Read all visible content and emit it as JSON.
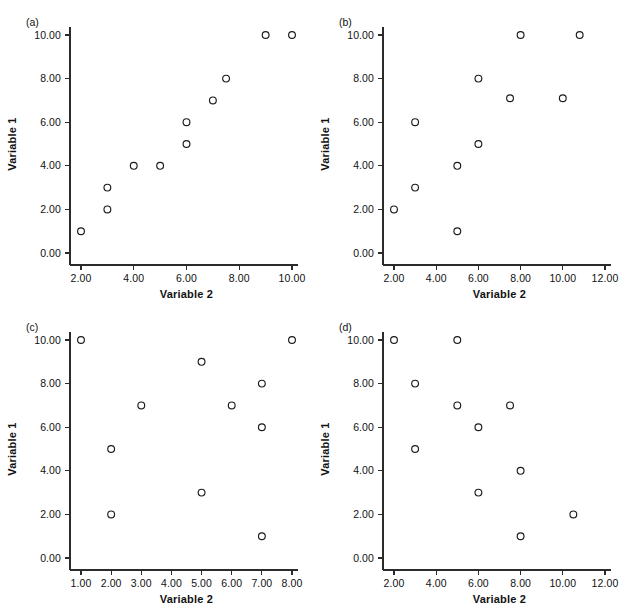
{
  "figure": {
    "panels": [
      {
        "key": "a",
        "label": "(a)",
        "xlabel": "Variable 2",
        "ylabel": "Variable 1",
        "xticks": [
          "2.00",
          "4.00",
          "6.00",
          "8.00",
          "10.00"
        ],
        "yticks": [
          "0.00",
          "2.00",
          "4.00",
          "6.00",
          "8.00",
          "10.00"
        ]
      },
      {
        "key": "b",
        "label": "(b)",
        "xlabel": "Variable 2",
        "ylabel": "Variable 1",
        "xticks": [
          "2.00",
          "4.00",
          "6.00",
          "8.00",
          "10.00",
          "12.00"
        ],
        "yticks": [
          "0.00",
          "2.00",
          "4.00",
          "6.00",
          "8.00",
          "10.00"
        ]
      },
      {
        "key": "c",
        "label": "(c)",
        "xlabel": "Variable 2",
        "ylabel": "Variable 1",
        "xticks": [
          "1.00",
          "2.00",
          "3.00",
          "4.00",
          "5.00",
          "6.00",
          "7.00",
          "8.00"
        ],
        "yticks": [
          "0.00",
          "2.00",
          "4.00",
          "6.00",
          "8.00",
          "10.00"
        ]
      },
      {
        "key": "d",
        "label": "(d)",
        "xlabel": "Variable 2",
        "ylabel": "Variable 1",
        "xticks": [
          "2.00",
          "4.00",
          "6.00",
          "8.00",
          "10.00",
          "12.00"
        ],
        "yticks": [
          "0.00",
          "2.00",
          "4.00",
          "6.00",
          "8.00",
          "10.00"
        ]
      }
    ]
  },
  "style": {
    "marker_color": "#1a1a1a",
    "axis_color": "#2b2b2b",
    "background": "#ffffff",
    "marker_radius": 3.4
  },
  "chart_data": [
    {
      "type": "scatter",
      "title": "(a)",
      "xlabel": "Variable 2",
      "ylabel": "Variable 1",
      "xlim": [
        1.2,
        10.6
      ],
      "ylim": [
        -0.6,
        10.6
      ],
      "xticks": [
        2,
        4,
        6,
        8,
        10
      ],
      "yticks": [
        0,
        2,
        4,
        6,
        8,
        10
      ],
      "grid": false,
      "legend": false,
      "points": [
        {
          "x": 2.0,
          "y": 1.0
        },
        {
          "x": 3.0,
          "y": 2.0
        },
        {
          "x": 3.0,
          "y": 3.0
        },
        {
          "x": 4.0,
          "y": 4.0
        },
        {
          "x": 5.0,
          "y": 4.0
        },
        {
          "x": 6.0,
          "y": 5.0
        },
        {
          "x": 6.0,
          "y": 6.0
        },
        {
          "x": 7.0,
          "y": 7.0
        },
        {
          "x": 7.5,
          "y": 8.0
        },
        {
          "x": 9.0,
          "y": 10.0
        },
        {
          "x": 10.0,
          "y": 10.0
        }
      ]
    },
    {
      "type": "scatter",
      "title": "(b)",
      "xlabel": "Variable 2",
      "ylabel": "Variable 1",
      "xlim": [
        1.4,
        12.6
      ],
      "ylim": [
        -0.6,
        10.6
      ],
      "xticks": [
        2,
        4,
        6,
        8,
        10,
        12
      ],
      "yticks": [
        0,
        2,
        4,
        6,
        8,
        10
      ],
      "grid": false,
      "legend": false,
      "points": [
        {
          "x": 2.0,
          "y": 2.0
        },
        {
          "x": 3.0,
          "y": 3.0
        },
        {
          "x": 3.0,
          "y": 6.0
        },
        {
          "x": 5.0,
          "y": 1.0
        },
        {
          "x": 5.0,
          "y": 4.0
        },
        {
          "x": 6.0,
          "y": 5.0
        },
        {
          "x": 6.0,
          "y": 8.0
        },
        {
          "x": 7.5,
          "y": 7.1
        },
        {
          "x": 8.0,
          "y": 10.0
        },
        {
          "x": 10.0,
          "y": 7.1
        },
        {
          "x": 10.8,
          "y": 10.0
        }
      ]
    },
    {
      "type": "scatter",
      "title": "(c)",
      "xlabel": "Variable 2",
      "ylabel": "Variable 1",
      "xlim": [
        0.6,
        8.5
      ],
      "ylim": [
        -0.6,
        10.6
      ],
      "xticks": [
        1,
        2,
        3,
        4,
        5,
        6,
        7,
        8
      ],
      "yticks": [
        0,
        2,
        4,
        6,
        8,
        10
      ],
      "grid": false,
      "legend": false,
      "points": [
        {
          "x": 1.0,
          "y": 10.0
        },
        {
          "x": 2.0,
          "y": 2.0
        },
        {
          "x": 2.0,
          "y": 5.0
        },
        {
          "x": 3.0,
          "y": 7.0
        },
        {
          "x": 5.0,
          "y": 3.0
        },
        {
          "x": 5.0,
          "y": 9.0
        },
        {
          "x": 6.0,
          "y": 7.0
        },
        {
          "x": 7.0,
          "y": 1.0
        },
        {
          "x": 7.0,
          "y": 6.0
        },
        {
          "x": 7.0,
          "y": 8.0
        },
        {
          "x": 8.0,
          "y": 10.0
        }
      ]
    },
    {
      "type": "scatter",
      "title": "(d)",
      "xlabel": "Variable 2",
      "ylabel": "Variable 1",
      "xlim": [
        1.4,
        12.6
      ],
      "ylim": [
        -0.6,
        10.6
      ],
      "xticks": [
        2,
        4,
        6,
        8,
        10,
        12
      ],
      "yticks": [
        0,
        2,
        4,
        6,
        8,
        10
      ],
      "grid": false,
      "legend": false,
      "points": [
        {
          "x": 2.0,
          "y": 10.0
        },
        {
          "x": 3.0,
          "y": 5.0
        },
        {
          "x": 3.0,
          "y": 8.0
        },
        {
          "x": 5.0,
          "y": 7.0
        },
        {
          "x": 5.0,
          "y": 10.0
        },
        {
          "x": 6.0,
          "y": 3.0
        },
        {
          "x": 6.0,
          "y": 6.0
        },
        {
          "x": 7.5,
          "y": 7.0
        },
        {
          "x": 8.0,
          "y": 1.0
        },
        {
          "x": 8.0,
          "y": 4.0
        },
        {
          "x": 10.5,
          "y": 2.0
        }
      ]
    }
  ]
}
